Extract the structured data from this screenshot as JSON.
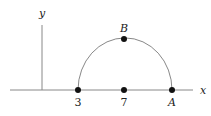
{
  "diagram": {
    "axes": {
      "x_label": "x",
      "y_label": "y"
    },
    "points": [
      {
        "id": "p3",
        "label": "3",
        "px": 78,
        "py": 90,
        "label_pos": "below"
      },
      {
        "id": "p7",
        "label": "7",
        "px": 124,
        "py": 90,
        "label_pos": "below"
      },
      {
        "id": "pA",
        "label": "A",
        "px": 172,
        "py": 90,
        "label_pos": "below"
      },
      {
        "id": "pB",
        "label": "B",
        "px": 124,
        "py": 39,
        "label_pos": "above"
      }
    ],
    "arc": {
      "description": "semicircle from 3 to A centered at 7 passing through B"
    },
    "colors": {
      "axis": "#888888",
      "arc": "#888888",
      "point": "#111111"
    }
  }
}
